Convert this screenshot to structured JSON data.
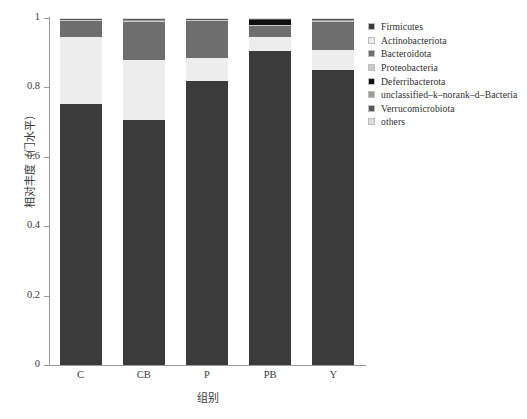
{
  "chart_data": {
    "type": "bar",
    "stacked": true,
    "title": "",
    "xlabel": "组别",
    "ylabel": "相对丰度（门水平）",
    "categories": [
      "C",
      "CB",
      "P",
      "PB",
      "Y"
    ],
    "ylim": [
      0,
      1
    ],
    "yticks": [
      0,
      0.2,
      0.4,
      0.6,
      0.8,
      1
    ],
    "ytick_labels": [
      "0",
      "0.2",
      "0.4",
      "0.6",
      "0.8",
      "1"
    ],
    "grid": false,
    "legend_position": "right",
    "series": [
      {
        "name": "Firmicutes",
        "color": "#3b3b3b",
        "values": [
          0.752,
          0.706,
          0.818,
          0.904,
          0.851
        ]
      },
      {
        "name": "Actinobacteriota",
        "color": "#ededed",
        "values": [
          0.192,
          0.172,
          0.068,
          0.042,
          0.058
        ]
      },
      {
        "name": "Bacteroidota",
        "color": "#6e6e6e",
        "values": [
          0.046,
          0.11,
          0.104,
          0.03,
          0.079
        ]
      },
      {
        "name": "Proteobacteria",
        "color": "#c8c8c8",
        "values": [
          0.004,
          0.004,
          0.004,
          0.004,
          0.004
        ]
      },
      {
        "name": "Deferribacterota",
        "color": "#101010",
        "values": [
          0.0,
          0.0,
          0.0,
          0.014,
          0.0
        ]
      },
      {
        "name": "unclassified-k-norank-d-Bacteria",
        "color": "#9c9c9c",
        "values": [
          0.002,
          0.002,
          0.002,
          0.002,
          0.002
        ]
      },
      {
        "name": "Verrucomicrobiota",
        "color": "#575757",
        "values": [
          0.002,
          0.004,
          0.002,
          0.002,
          0.004
        ]
      },
      {
        "name": "others",
        "color": "#dcdcdc",
        "values": [
          0.002,
          0.002,
          0.002,
          0.002,
          0.002
        ]
      }
    ]
  },
  "legend": {
    "items": [
      {
        "label": "Firmicutes",
        "color": "#3b3b3b"
      },
      {
        "label": "Actinobacteriota",
        "color": "#ededed"
      },
      {
        "label": "Bacteroidota",
        "color": "#6e6e6e"
      },
      {
        "label": "Proteobacteria",
        "color": "#c8c8c8"
      },
      {
        "label": "Deferribacterota",
        "color": "#101010"
      },
      {
        "label": "unclassified–k–norank–d–Bacteria",
        "color": "#9c9c9c"
      },
      {
        "label": "Verrucomicrobiota",
        "color": "#575757"
      },
      {
        "label": "others",
        "color": "#dcdcdc"
      }
    ]
  },
  "axes": {
    "y_title": "相对丰度（门水平）",
    "x_title": "组别",
    "axis_color": "#9a9a9a"
  }
}
